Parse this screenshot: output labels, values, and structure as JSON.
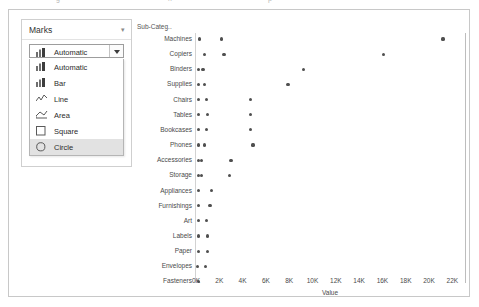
{
  "top_strip": {
    "fragments": [
      {
        "text": "g",
        "x": 56
      },
      {
        "text": "rr",
        "x": 168
      },
      {
        "text": "p",
        "x": 268
      }
    ]
  },
  "marks_card": {
    "title": "Marks",
    "collapse_icon": "chevron-down-icon",
    "combo": {
      "value": "Automatic",
      "icon": "bar-mark-icon",
      "arrow_icon": "caret-down-icon"
    },
    "options": [
      {
        "label": "Automatic",
        "icon": "bar-mark-icon",
        "selected": false
      },
      {
        "label": "Bar",
        "icon": "bar-mark-icon",
        "selected": false
      },
      {
        "label": "Line",
        "icon": "line-mark-icon",
        "selected": false
      },
      {
        "label": "Area",
        "icon": "area-mark-icon",
        "selected": false
      },
      {
        "label": "Square",
        "icon": "square-mark-icon",
        "selected": false
      },
      {
        "label": "Circle",
        "icon": "circle-mark-icon",
        "selected": true
      }
    ]
  },
  "chart_data": {
    "type": "scatter",
    "title": "",
    "column_header": "Sub-Categ..",
    "xlabel": "Value",
    "ylabel": "",
    "xlim": [
      0,
      23000
    ],
    "xticks": [
      0,
      2000,
      4000,
      6000,
      8000,
      10000,
      12000,
      14000,
      16000,
      18000,
      20000,
      22000
    ],
    "xticklabels": [
      "0K",
      "2K",
      "4K",
      "6K",
      "8K",
      "10K",
      "12K",
      "14K",
      "16K",
      "18K",
      "20K",
      "22K"
    ],
    "grid": false,
    "legend": false,
    "mark_color": "#4f4f4f",
    "categories": [
      "Machines",
      "Copiers",
      "Binders",
      "Supplies",
      "Chairs",
      "Tables",
      "Bookcases",
      "Phones",
      "Accessories",
      "Storage",
      "Appliances",
      "Furnishings",
      "Art",
      "Labels",
      "Paper",
      "Envelopes",
      "Fasteners"
    ],
    "points": [
      {
        "category": "Machines",
        "values": [
          300,
          2200,
          21200
        ]
      },
      {
        "category": "Copiers",
        "values": [
          700,
          2400,
          16100
        ]
      },
      {
        "category": "Binders",
        "values": [
          200,
          600,
          9200
        ]
      },
      {
        "category": "Supplies",
        "values": [
          200,
          700,
          7900
        ]
      },
      {
        "category": "Chairs",
        "values": [
          200,
          900,
          4700
        ]
      },
      {
        "category": "Tables",
        "values": [
          200,
          1000,
          4700
        ]
      },
      {
        "category": "Bookcases",
        "values": [
          200,
          900,
          4700
        ]
      },
      {
        "category": "Phones",
        "values": [
          200,
          700,
          4900
        ]
      },
      {
        "category": "Accessories",
        "values": [
          200,
          500,
          3000
        ]
      },
      {
        "category": "Storage",
        "values": [
          200,
          500,
          2900
        ]
      },
      {
        "category": "Appliances",
        "values": [
          200,
          1300
        ]
      },
      {
        "category": "Furnishings",
        "values": [
          200,
          1200
        ]
      },
      {
        "category": "Art",
        "values": [
          200,
          900
        ]
      },
      {
        "category": "Labels",
        "values": [
          200,
          1000
        ]
      },
      {
        "category": "Paper",
        "values": [
          200,
          1000
        ]
      },
      {
        "category": "Envelopes",
        "values": [
          100,
          800
        ]
      },
      {
        "category": "Fasteners",
        "values": [
          200
        ]
      }
    ]
  }
}
